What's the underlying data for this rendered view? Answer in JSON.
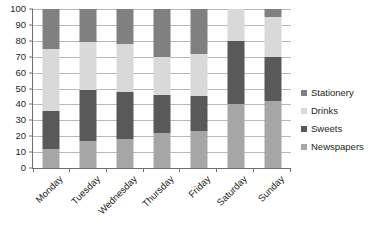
{
  "chart_data": {
    "type": "bar",
    "subtype": "100% stacked column",
    "title": "",
    "xlabel": "",
    "ylabel": "",
    "ylim": [
      0,
      100
    ],
    "ytick_step": 10,
    "yticks": [
      0,
      10,
      20,
      30,
      40,
      50,
      60,
      70,
      80,
      90,
      100
    ],
    "ytick_labels": [
      "0",
      "10",
      "20",
      "30",
      "40",
      "50",
      "60",
      "70",
      "80",
      "90",
      "100"
    ],
    "grid": true,
    "grid_axis": "y",
    "legend": true,
    "legend_position": "right",
    "stack_order_bottom_to_top": [
      "Newspapers",
      "Sweets",
      "Drinks",
      "Stationery"
    ],
    "categories": [
      "Monday",
      "Tuesday",
      "Wednesday",
      "Thursday",
      "Friday",
      "Saturday",
      "Sunday"
    ],
    "series": [
      {
        "name": "Stationery",
        "color": "#808080",
        "values": [
          25,
          21,
          22,
          30,
          28,
          0,
          5
        ]
      },
      {
        "name": "Drinks",
        "color": "#d9d9d9",
        "values": [
          39,
          30,
          30,
          24,
          27,
          20,
          25
        ]
      },
      {
        "name": "Sweets",
        "color": "#595959",
        "values": [
          24,
          32,
          30,
          24,
          22,
          40,
          28
        ]
      },
      {
        "name": "Newspapers",
        "color": "#a6a6a6",
        "values": [
          12,
          17,
          18,
          22,
          23,
          40,
          42
        ]
      }
    ]
  },
  "colors": {
    "background": "#ffffff",
    "axis": "#6f6f6f",
    "gridline": "#b8b8b8",
    "text": "#231f20"
  }
}
